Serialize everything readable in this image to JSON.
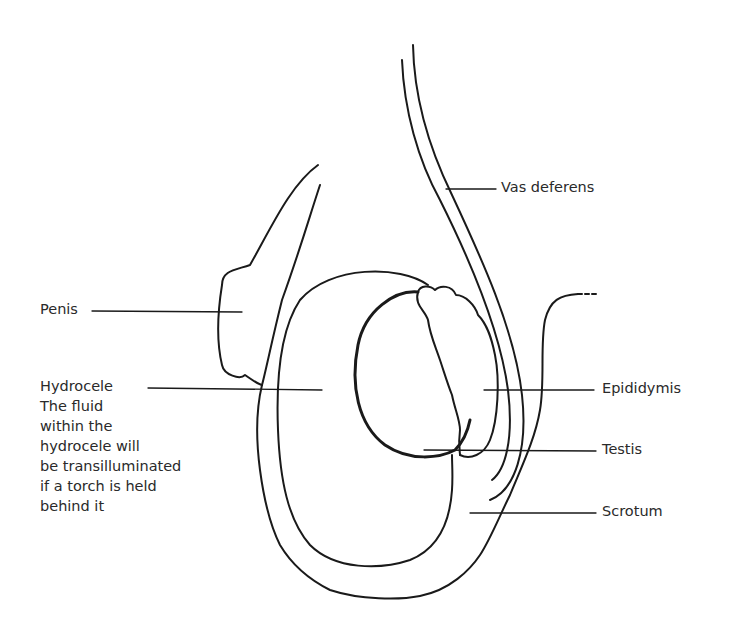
{
  "diagram": {
    "labels": {
      "vas_deferens": "Vas deferens",
      "penis": "Penis",
      "hydrocele": "Hydrocele",
      "hydrocele_note_lines": [
        "The fluid",
        "within the",
        "hydrocele will",
        "be transilluminated",
        "if a torch is held",
        "behind it"
      ],
      "epididymis": "Epididymis",
      "testis": "Testis",
      "scrotum": "Scrotum"
    },
    "colors": {
      "line": "#1a1a1a",
      "text": "#2a2a2a",
      "background": "#ffffff"
    }
  }
}
